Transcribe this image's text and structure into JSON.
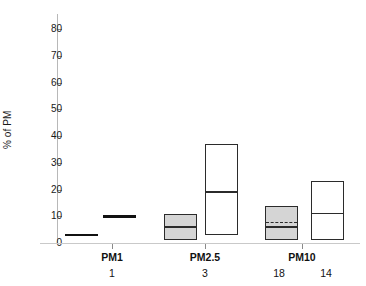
{
  "chart_data": {
    "type": "box",
    "title": "",
    "xlabel": "",
    "ylabel": "% of PM",
    "ylim": [
      0,
      85
    ],
    "ytick_labels": [
      "0",
      "10",
      "20",
      "30",
      "40",
      "50",
      "60",
      "70",
      "80"
    ],
    "ytick_values": [
      0,
      10,
      20,
      30,
      40,
      50,
      60,
      70,
      80
    ],
    "grid": false,
    "legend": "none",
    "categories": [
      "PM1",
      "PM2.5",
      "PM10"
    ],
    "category_counts": [
      "1",
      "3",
      "18",
      "14"
    ],
    "colors": {
      "shaded_fill": "#d5d5d5",
      "open_fill": "#ffffff",
      "box_border": "#2b2b2b",
      "axis": "#b8b8b8",
      "text": "#111111"
    },
    "boxes": [
      {
        "group": "PM1",
        "series": "shaded",
        "n": "1",
        "min": 3,
        "q1": 3,
        "median": 3,
        "q3": 3,
        "max": 3,
        "degenerate": true
      },
      {
        "group": "PM1",
        "series": "open",
        "n": "",
        "min": 10,
        "q1": 10,
        "median": 10,
        "q3": 10,
        "max": 10,
        "degenerate": true
      },
      {
        "group": "PM2.5",
        "series": "shaded",
        "n": "3",
        "q1": 1,
        "median": 6,
        "q3": 11,
        "degenerate": false
      },
      {
        "group": "PM2.5",
        "series": "open",
        "n": "",
        "q1": 3,
        "median": 19,
        "q3": 37,
        "degenerate": false
      },
      {
        "group": "PM10",
        "series": "shaded",
        "n": "18",
        "q1": 1,
        "median": 6,
        "mean": 8,
        "q3": 14,
        "degenerate": false
      },
      {
        "group": "PM10",
        "series": "open",
        "n": "14",
        "q1": 1,
        "median": 11,
        "q3": 23,
        "degenerate": false
      }
    ]
  },
  "axes": {
    "y_label": "% of PM",
    "y_ticks": [
      {
        "label": "80",
        "value": 80
      },
      {
        "label": "70",
        "value": 70
      },
      {
        "label": "60",
        "value": 60
      },
      {
        "label": "50",
        "value": 50
      },
      {
        "label": "40",
        "value": 40
      },
      {
        "label": "30",
        "value": 30
      },
      {
        "label": "20",
        "value": 20
      },
      {
        "label": "10",
        "value": 10
      },
      {
        "label": "0",
        "value": 0
      }
    ],
    "x_groups": [
      {
        "label": "PM1",
        "center": 112
      },
      {
        "label": "PM2.5",
        "center": 205
      },
      {
        "label": "PM10",
        "center": 302
      }
    ],
    "x_counts": [
      {
        "label": "1",
        "center": 112
      },
      {
        "label": "3",
        "center": 205
      },
      {
        "label": "18",
        "center": 279
      },
      {
        "label": "14",
        "center": 326
      }
    ]
  }
}
